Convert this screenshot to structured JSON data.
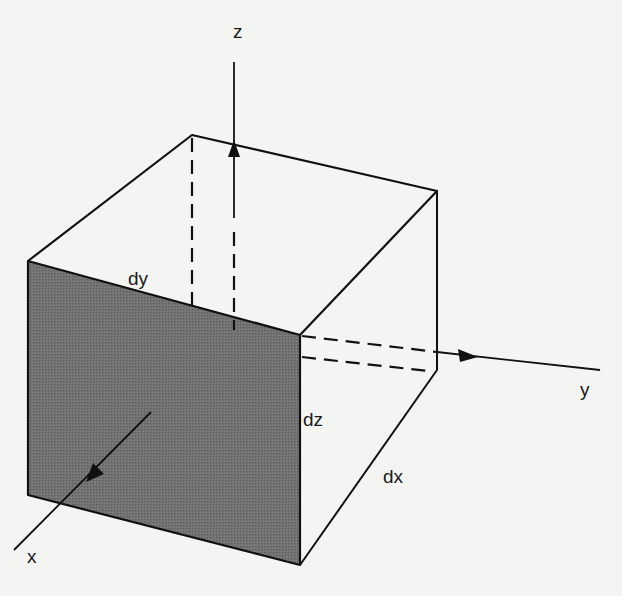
{
  "diagram": {
    "type": "differential-volume-element",
    "colors": {
      "background": "#f4f4f2",
      "stroke": "#111111",
      "shaded_face": "#6b6b6b",
      "bleed_text": "#d9d9d6"
    },
    "axes": {
      "x": {
        "label": "x"
      },
      "y": {
        "label": "y"
      },
      "z": {
        "label": "z"
      }
    },
    "dimensions": {
      "dx": {
        "label": "dx"
      },
      "dy": {
        "label": "dy"
      },
      "dz": {
        "label": "dz"
      }
    }
  }
}
